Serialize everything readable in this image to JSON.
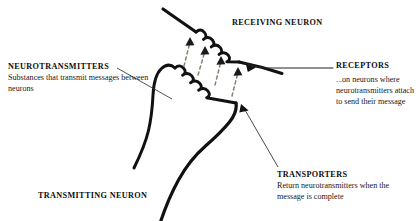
{
  "diagram": {
    "background_color": "#ffffff",
    "ink_color": "#111111",
    "arrow_color": "#8a8070"
  },
  "labels": {
    "neurotransmitters": {
      "heading": "NEUROTRANSMITTERS",
      "body": "Substances that transmit messages between neurons"
    },
    "receiving_neuron": {
      "heading": "RECEIVING NEURON"
    },
    "receptors": {
      "heading": "RECEPTORS",
      "body": "...on neurons where neurotransmitters attach to send their message"
    },
    "transporters": {
      "heading": "TRANSPORTERS",
      "body": "Return neurotransmitters when the message is complete"
    },
    "transmitting_neuron": {
      "heading": "TRANSMITTING NEURON"
    }
  },
  "icons": {
    "neurotransmitter_arrow": "dashed-up-arrow-icon",
    "receptor_pointer": "curved-leader-arrow-icon",
    "transporter_pointer": "straight-leader-arrow-icon",
    "leader_line": "leader-line-icon"
  },
  "structures": {
    "transmitting_terminal": "presynaptic-axon-terminal",
    "receiving_dendrite": "postsynaptic-dendrite",
    "synaptic_cleft": "synaptic-cleft",
    "arrow_count": 4
  }
}
